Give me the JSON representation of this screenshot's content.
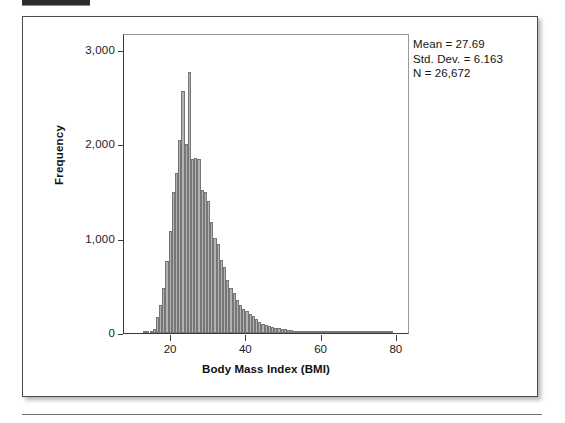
{
  "figure": {
    "background_color": "#ffffff",
    "border_color": "#4a4a4a"
  },
  "stats": {
    "mean_line": "Mean = 27.69",
    "std_dev_line": "Std. Dev. = 6.163",
    "n_line": "N = 26,672"
  },
  "chart_data": {
    "type": "bar",
    "subtype": "histogram",
    "title": "",
    "xlabel": "Body Mass Index (BMI)",
    "ylabel": "Frequency",
    "xlim": [
      7.5,
      83.5
    ],
    "ylim": [
      0,
      3180
    ],
    "xticks": [
      20,
      40,
      60,
      80
    ],
    "xtick_labels": [
      "20",
      "40",
      "60",
      "80"
    ],
    "yticks": [
      0,
      1000,
      2000,
      3000
    ],
    "ytick_labels": [
      "0",
      "1,000",
      "2,000",
      "3,000"
    ],
    "grid": false,
    "legend": false,
    "bar_color": "#b2b2b2",
    "bar_edge_color": "#767676",
    "bin_width": 0.85,
    "annotations": [
      "Mean = 27.69",
      "Std. Dev. = 6.163",
      "N = 26,672"
    ],
    "x": [
      13.0,
      13.85,
      14.7,
      15.55,
      16.4,
      17.25,
      18.1,
      18.95,
      19.8,
      20.65,
      21.5,
      22.35,
      23.2,
      24.05,
      24.9,
      25.75,
      26.6,
      27.45,
      28.3,
      29.15,
      30.0,
      30.85,
      31.7,
      32.55,
      33.4,
      34.25,
      35.1,
      35.95,
      36.8,
      37.65,
      38.5,
      39.35,
      40.2,
      41.05,
      41.9,
      42.75,
      43.6,
      44.45,
      45.3,
      46.15,
      47.0,
      47.85,
      48.7,
      49.55,
      50.4,
      51.25,
      52.1,
      52.95,
      53.8,
      54.65,
      55.5,
      56.35,
      57.2,
      58.05,
      58.9,
      59.75,
      60.6,
      61.45,
      62.3,
      63.15,
      64.0,
      64.85,
      65.7,
      66.55,
      67.4,
      68.25,
      69.1,
      69.95,
      70.8,
      71.65,
      72.5,
      73.35,
      74.2,
      75.05,
      75.9,
      76.75,
      77.6,
      78.45
    ],
    "values": [
      10,
      14,
      22,
      40,
      170,
      300,
      480,
      760,
      1080,
      1500,
      1700,
      2050,
      2570,
      2000,
      2770,
      1840,
      1850,
      1840,
      1520,
      1500,
      1400,
      1180,
      1010,
      940,
      770,
      700,
      560,
      480,
      420,
      350,
      300,
      250,
      230,
      200,
      180,
      150,
      120,
      100,
      90,
      70,
      60,
      55,
      50,
      45,
      42,
      35,
      30,
      25,
      22,
      18,
      15,
      12,
      10,
      9,
      8,
      7,
      6,
      5,
      5,
      4,
      4,
      3,
      3,
      3,
      2,
      2,
      2,
      2,
      2,
      2,
      2,
      2,
      2,
      5,
      6,
      5,
      3,
      2
    ]
  }
}
